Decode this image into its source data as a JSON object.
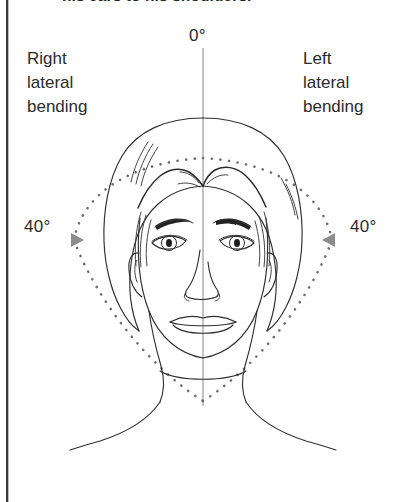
{
  "figure": {
    "caption_clipped": "his ears to his shoulders."
  },
  "labels": {
    "neutral_angle": "0°",
    "right_bending": "Right\nlateral\nbending",
    "right_bending_line1": "Right",
    "right_bending_line2": "lateral",
    "right_bending_line3": "bending",
    "left_bending_line1": "Left",
    "left_bending_line2": "lateral",
    "left_bending_line3": "bending",
    "right_angle": "40°",
    "left_angle": "40°"
  },
  "measurements": {
    "neutral_degrees": 0,
    "right_lateral_bending_degrees": 40,
    "left_lateral_bending_degrees": 40,
    "total_arc_degrees": 80,
    "unit": "degrees"
  },
  "icons": {
    "right_marker": "triangle-right-icon",
    "left_marker": "triangle-left-icon",
    "reference_axis": "vertical-axis-line",
    "arc_guide": "dotted-arc-guide"
  },
  "colors": {
    "background": "#ffffff",
    "line_art": "#2f2f2f",
    "axis_gray": "#9a9a9a",
    "dotted_guide": "#6e6e6e",
    "marker_gray": "#8d8d8d",
    "text": "#2b2b2b",
    "page_edge": "#3a3a3a"
  },
  "geometry": {
    "axis_top_y": 48,
    "axis_bottom_y": 406,
    "axis_x": 203,
    "arc_apex_top_y": 158,
    "arc_vertex_bottom_y": 402,
    "right_marker_x": 76,
    "left_marker_x": 330,
    "marker_y": 240
  }
}
